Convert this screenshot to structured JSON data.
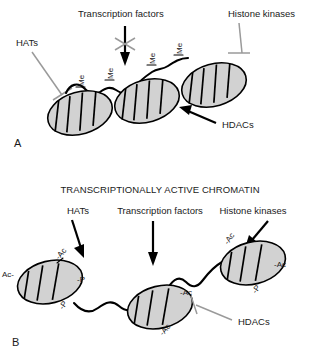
{
  "figure": {
    "panels": [
      {
        "letter": "A",
        "title": "",
        "state": "condensed transcriptionally inactive chromatin",
        "labels": [
          {
            "id": "hats",
            "text": "HATs",
            "connector": "inhibition",
            "connector_color": "#9a9a9a",
            "target": "nucleosome-1"
          },
          {
            "id": "transcription-factors",
            "text": "Transcription factors",
            "connector": "arrow-blocked",
            "connector_color": "#000000",
            "blocked": true,
            "target": "linker-dna"
          },
          {
            "id": "histone-kinases",
            "text": "Histone kinases",
            "connector": "inhibition",
            "connector_color": "#9a9a9a",
            "target": "nucleosome-3"
          },
          {
            "id": "hdacs",
            "text": "HDACs",
            "connector": "arrow",
            "connector_color": "#000000",
            "target": "nucleosome-2"
          }
        ],
        "modifications": [
          {
            "text": "Me",
            "index": 1
          },
          {
            "text": "Me",
            "index": 2
          },
          {
            "text": "Me",
            "index": 3
          },
          {
            "text": "Me",
            "index": 4
          }
        ],
        "nucleosome_count": 3,
        "nucleosome_stripes": 4
      },
      {
        "letter": "B",
        "title": "TRANSCRIPTIONALLY ACTIVE CHROMATIN",
        "state": "open transcriptionally active chromatin",
        "labels": [
          {
            "id": "hats",
            "text": "HATs",
            "connector": "arrow",
            "connector_color": "#000000",
            "target": "nucleosome-1"
          },
          {
            "id": "transcription-factors",
            "text": "Transcription factors",
            "connector": "arrow",
            "connector_color": "#000000",
            "target": "linker-dna"
          },
          {
            "id": "histone-kinases",
            "text": "Histone kinases",
            "connector": "arrow",
            "connector_color": "#000000",
            "target": "nucleosome-3"
          },
          {
            "id": "hdacs",
            "text": "HDACs",
            "connector": "inhibition",
            "connector_color": "#9a9a9a",
            "target": "nucleosome-2"
          }
        ],
        "modifications": [
          {
            "text": "Ac-",
            "nucleosome": 1,
            "position": "left"
          },
          {
            "text": "-Ac",
            "nucleosome": 1,
            "position": "top-right"
          },
          {
            "text": "-P",
            "nucleosome": 1,
            "position": "right"
          },
          {
            "text": "-P",
            "nucleosome": 1,
            "position": "bottom-right"
          },
          {
            "text": "-Ac",
            "nucleosome": 2,
            "position": "right"
          },
          {
            "text": "-Ac",
            "nucleosome": 2,
            "position": "bottom"
          },
          {
            "text": "-Ac",
            "nucleosome": 3,
            "position": "top-left"
          },
          {
            "text": "-Ac",
            "nucleosome": 3,
            "position": "right"
          },
          {
            "text": "-P",
            "nucleosome": 3,
            "position": "bottom-right"
          }
        ],
        "nucleosome_count": 3,
        "nucleosome_stripes": 3
      }
    ],
    "colors": {
      "nucleosome_fill": "#d2d2d2",
      "outline": "#000000",
      "inhibition_gray": "#9a9a9a",
      "background": "#ffffff"
    }
  }
}
